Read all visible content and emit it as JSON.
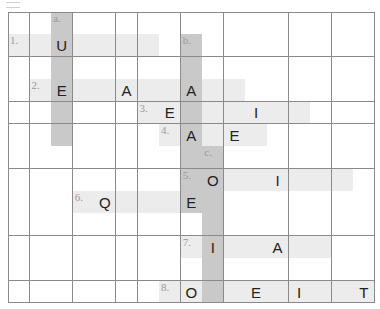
{
  "puzzle": {
    "rows": 13,
    "cols": 17,
    "colors": {
      "across_shade": "#ececec",
      "down_shade": "#c9c9c9",
      "grid_line": "#8a8a8a"
    },
    "across": [
      {
        "label": "1.",
        "row": 1,
        "col": 0,
        "length": 7,
        "given": {
          "2": "U"
        }
      },
      {
        "label": "2.",
        "row": 3,
        "col": 1,
        "length": 10,
        "given": {
          "1": "E",
          "4": "A",
          "7": "A"
        }
      },
      {
        "label": "3.",
        "row": 4,
        "col": 6,
        "length": 8,
        "given": {
          "1": "E",
          "5": "I"
        }
      },
      {
        "label": "4.",
        "row": 5,
        "col": 7,
        "length": 5,
        "given": {
          "1": "A",
          "3": "E"
        }
      },
      {
        "label": "5.",
        "row": 7,
        "col": 8,
        "length": 8,
        "given": {
          "1": "O",
          "4": "I"
        }
      },
      {
        "label": "6.",
        "row": 8,
        "col": 3,
        "length": 6,
        "given": {
          "1": "Q",
          "5": "E"
        }
      },
      {
        "label": "7.",
        "row": 10,
        "col": 8,
        "length": 7,
        "given": {
          "1": "I",
          "4": "A"
        }
      },
      {
        "label": "8.",
        "row": 12,
        "col": 7,
        "length": 10,
        "given": {
          "1": "O",
          "4": "E",
          "6": "I",
          "9": "T"
        }
      }
    ],
    "down": [
      {
        "label": "a.",
        "row": 0,
        "col": 2,
        "length": 6
      },
      {
        "label": "b.",
        "row": 1,
        "col": 8,
        "length": 8
      },
      {
        "label": "c.",
        "row": 6,
        "col": 9,
        "length": 7
      }
    ]
  }
}
